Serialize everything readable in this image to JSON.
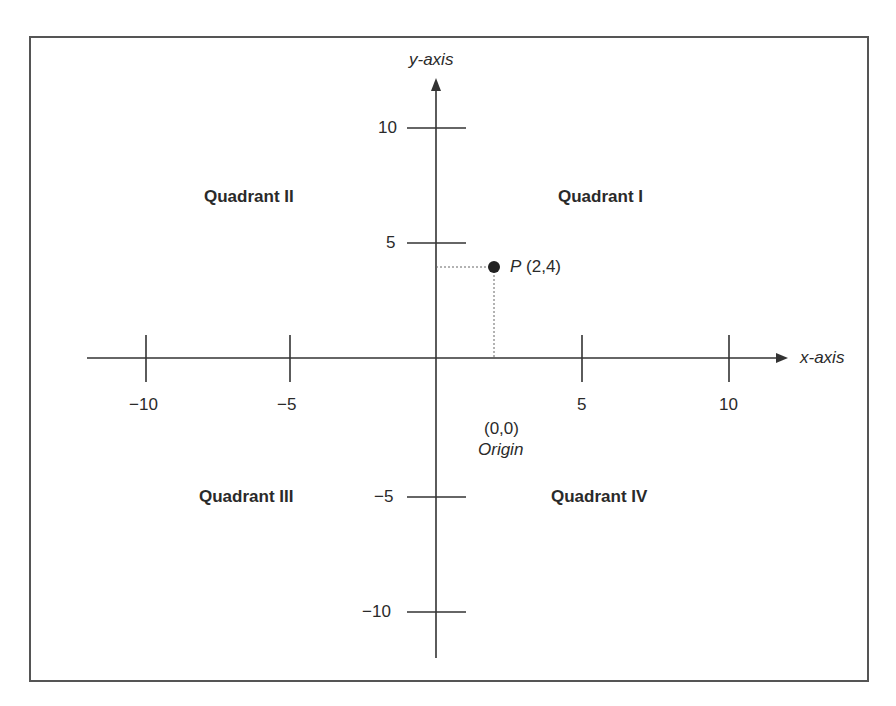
{
  "diagram": {
    "axes": {
      "x_label": "x-axis",
      "y_label": "y-axis",
      "x_ticks": [
        {
          "value": -10,
          "label": "−10"
        },
        {
          "value": -5,
          "label": "−5"
        },
        {
          "value": 5,
          "label": "5"
        },
        {
          "value": 10,
          "label": "10"
        }
      ],
      "y_ticks": [
        {
          "value": 10,
          "label": "10"
        },
        {
          "value": 5,
          "label": "5"
        },
        {
          "value": -5,
          "label": "−5"
        },
        {
          "value": -10,
          "label": "−10"
        }
      ]
    },
    "quadrants": {
      "q1": "Quadrant I",
      "q2": "Quadrant II",
      "q3": "Quadrant III",
      "q4": "Quadrant IV"
    },
    "point": {
      "name": "P",
      "coords": "(2,4)",
      "x": 2,
      "y": 4
    },
    "origin": {
      "coords": "(0,0)",
      "label": "Origin"
    }
  }
}
